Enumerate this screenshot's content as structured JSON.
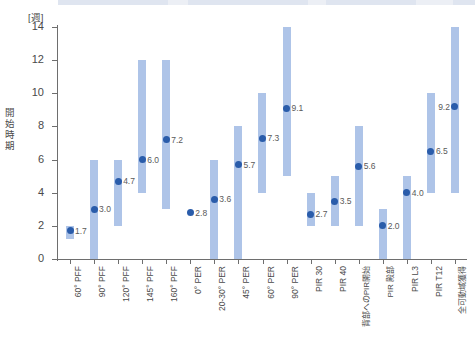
{
  "chart_data": {
    "type": "bar",
    "chart_subtype": "range-bar-with-mean-point",
    "title": "",
    "xlabel": "",
    "ylabel": "開始時期",
    "yunit": "[週]",
    "ylim": [
      0,
      14
    ],
    "yticks": [
      0,
      2,
      4,
      6,
      8,
      10,
      12,
      14
    ],
    "grid": false,
    "legend": false,
    "colors": {
      "range_bar": "#aec4e8",
      "point": "#2a5caa",
      "axis": "#6e6e6e",
      "text": "#4a4a4a",
      "label_text": "#5a5a5a",
      "background": "#ffffff"
    },
    "categories": [
      "60° PFF",
      "90° PFF",
      "120° PFF",
      "145° PFF",
      "160° PFF",
      "0° PER",
      "20-30° PER",
      "45° PER",
      "60° PER",
      "90° PER",
      "PIR 30",
      "PIR 40",
      "背部へのPIR開始",
      "PIR 殿部",
      "PIR L3",
      "PIR T12",
      "全可動域獲得"
    ],
    "series": [
      {
        "name": "開始時期 (平均)",
        "values": [
          1.7,
          3.0,
          4.7,
          6.0,
          7.2,
          2.8,
          3.6,
          5.7,
          7.3,
          9.1,
          2.7,
          3.5,
          5.6,
          2.0,
          4.0,
          6.5,
          9.2
        ]
      }
    ],
    "ranges": [
      {
        "category": "60° PFF",
        "low": 1.2,
        "high": 2.0
      },
      {
        "category": "90° PFF",
        "low": 0.0,
        "high": 6.0
      },
      {
        "category": "120° PFF",
        "low": 2.0,
        "high": 6.0
      },
      {
        "category": "145° PFF",
        "low": 4.0,
        "high": 12.0
      },
      {
        "category": "160° PFF",
        "low": 3.0,
        "high": 12.0
      },
      {
        "category": "0° PER",
        "low": null,
        "high": null
      },
      {
        "category": "20-30° PER",
        "low": 0.0,
        "high": 6.0
      },
      {
        "category": "45° PER",
        "low": 0.0,
        "high": 8.0
      },
      {
        "category": "60° PER",
        "low": 4.0,
        "high": 10.0
      },
      {
        "category": "90° PER",
        "low": 5.0,
        "high": 14.0
      },
      {
        "category": "PIR 30",
        "low": 2.0,
        "high": 4.0
      },
      {
        "category": "PIR 40",
        "low": 2.0,
        "high": 5.0
      },
      {
        "category": "背部へのPIR開始",
        "low": 2.0,
        "high": 8.0
      },
      {
        "category": "PIR 殿部",
        "low": 0.0,
        "high": 3.0
      },
      {
        "category": "PIR L3",
        "low": 0.0,
        "high": 5.0
      },
      {
        "category": "PIR T12",
        "low": 4.0,
        "high": 10.0
      },
      {
        "category": "全可動域獲得",
        "low": 4.0,
        "high": 14.0
      }
    ],
    "point_labels": [
      "1.7",
      "3.0",
      "4.7",
      "6.0",
      "7.2",
      "2.8",
      "3.6",
      "5.7",
      "7.3",
      "9.1",
      "2.7",
      "3.5",
      "5.6",
      "2.0",
      "4.0",
      "6.5",
      "9.2"
    ],
    "point_label_side": [
      "right",
      "right",
      "right",
      "right",
      "right",
      "right",
      "right",
      "right",
      "right",
      "right",
      "right",
      "right",
      "right",
      "right",
      "right",
      "right",
      "left"
    ]
  }
}
